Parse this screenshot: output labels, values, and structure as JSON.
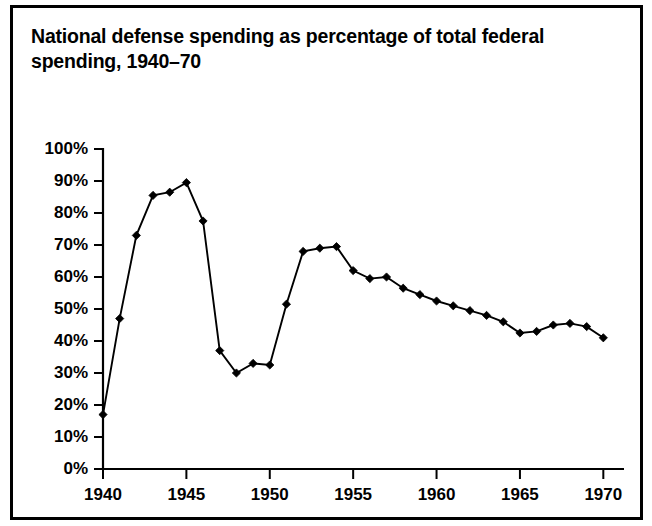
{
  "figure": {
    "title": "National defense spending as percentage of total federal spending, 1940–70",
    "border_color": "#000000",
    "background": "#ffffff"
  },
  "chart_data": {
    "type": "line",
    "title": "National defense spending as percentage of total federal spending, 1940–70",
    "xlabel": "",
    "ylabel": "",
    "xlim": [
      1940,
      1971
    ],
    "ylim": [
      0,
      100
    ],
    "grid": false,
    "legend": null,
    "line_color": "#000000",
    "marker": "diamond",
    "marker_color": "#000000",
    "x_ticks": [
      1940,
      1945,
      1950,
      1955,
      1960,
      1965,
      1970
    ],
    "x_tick_labels": [
      "1940",
      "1945",
      "1950",
      "1955",
      "1960",
      "1965",
      "1970"
    ],
    "x_minor_ticks": [
      1941,
      1942,
      1943,
      1944,
      1946,
      1947,
      1948,
      1949,
      1951,
      1952,
      1953,
      1954,
      1956,
      1957,
      1958,
      1959,
      1961,
      1962,
      1963,
      1964,
      1966,
      1967,
      1968,
      1969,
      1971
    ],
    "y_ticks": [
      0,
      10,
      20,
      30,
      40,
      50,
      60,
      70,
      80,
      90,
      100
    ],
    "y_tick_labels": [
      "0%",
      "10%",
      "20%",
      "30%",
      "40%",
      "50%",
      "60%",
      "70%",
      "80%",
      "90%",
      "100%"
    ],
    "x": [
      1940,
      1941,
      1942,
      1943,
      1944,
      1945,
      1946,
      1947,
      1948,
      1949,
      1950,
      1951,
      1952,
      1953,
      1954,
      1955,
      1956,
      1957,
      1958,
      1959,
      1960,
      1961,
      1962,
      1963,
      1964,
      1965,
      1966,
      1967,
      1968,
      1969,
      1970
    ],
    "values": [
      17,
      47,
      73,
      85.5,
      86.5,
      89.5,
      77.5,
      37,
      30,
      33,
      32.5,
      51.5,
      68,
      69,
      69.5,
      62,
      59.5,
      60,
      56.5,
      54.5,
      52.5,
      51,
      49.5,
      48,
      46,
      42.5,
      43,
      45,
      45.5,
      44.5,
      41
    ],
    "series": [
      {
        "name": "National defense spending (% of total federal spending)",
        "values": [
          17,
          47,
          73,
          85.5,
          86.5,
          89.5,
          77.5,
          37,
          30,
          33,
          32.5,
          51.5,
          68,
          69,
          69.5,
          62,
          59.5,
          60,
          56.5,
          54.5,
          52.5,
          51,
          49.5,
          48,
          46,
          42.5,
          43,
          45,
          45.5,
          44.5,
          41
        ]
      }
    ]
  }
}
